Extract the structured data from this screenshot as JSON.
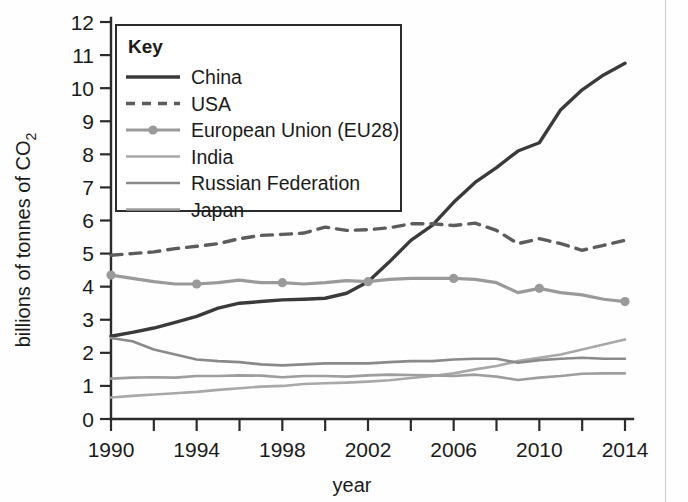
{
  "figure": {
    "background_color": "#fefefe",
    "axis_color": "#2b2b2b"
  },
  "axes": {
    "y_title": "billions of tonnes of CO",
    "y_title_sub": "2",
    "x_title": "year",
    "y_ticks": [
      "0",
      "1",
      "2",
      "3",
      "4",
      "5",
      "6",
      "7",
      "8",
      "9",
      "10",
      "11",
      "12"
    ],
    "x_ticks": [
      "1990",
      "1994",
      "1998",
      "2002",
      "2006",
      "2010",
      "2014"
    ],
    "x_minor_years": [
      1992,
      1996,
      2000,
      2004,
      2008,
      2012
    ]
  },
  "legend": {
    "title": "Key",
    "items": [
      {
        "label": "China",
        "color": "#3a3a3a",
        "style": "solid",
        "width": 3.4,
        "marker": false
      },
      {
        "label": "USA",
        "color": "#5c5c5c",
        "style": "dashed",
        "width": 3.4,
        "marker": false
      },
      {
        "label": "European Union (EU28)",
        "color": "#9a9a9a",
        "style": "solid",
        "width": 3.2,
        "marker": true
      },
      {
        "label": "India",
        "color": "#a8a8a8",
        "style": "solid",
        "width": 2.6,
        "marker": false
      },
      {
        "label": "Russian Federation",
        "color": "#8a8a8a",
        "style": "solid",
        "width": 2.6,
        "marker": false
      },
      {
        "label": "Japan",
        "color": "#9e9e9e",
        "style": "solid",
        "width": 2.6,
        "marker": false
      }
    ]
  },
  "chart_data": {
    "type": "line",
    "title": "",
    "xlabel": "year",
    "ylabel": "billions of tonnes of CO2",
    "xlim": [
      1990,
      2014
    ],
    "ylim": [
      0,
      12
    ],
    "grid": false,
    "legend_position": "upper-left-inset",
    "x": [
      1990,
      1991,
      1992,
      1993,
      1994,
      1995,
      1996,
      1997,
      1998,
      1999,
      2000,
      2001,
      2002,
      2003,
      2004,
      2005,
      2006,
      2007,
      2008,
      2009,
      2010,
      2011,
      2012,
      2013,
      2014
    ],
    "series": [
      {
        "name": "China",
        "color": "#3a3a3a",
        "style": "solid",
        "values": [
          2.5,
          2.62,
          2.75,
          2.92,
          3.1,
          3.35,
          3.5,
          3.55,
          3.6,
          3.62,
          3.65,
          3.8,
          4.15,
          4.75,
          5.4,
          5.85,
          6.55,
          7.15,
          7.6,
          8.1,
          8.35,
          9.35,
          9.95,
          10.4,
          10.75
        ]
      },
      {
        "name": "USA",
        "color": "#5c5c5c",
        "style": "dashed",
        "values": [
          4.95,
          5.0,
          5.05,
          5.15,
          5.22,
          5.3,
          5.45,
          5.55,
          5.58,
          5.62,
          5.8,
          5.7,
          5.72,
          5.78,
          5.9,
          5.9,
          5.85,
          5.92,
          5.7,
          5.3,
          5.45,
          5.3,
          5.1,
          5.25,
          5.4
        ]
      },
      {
        "name": "European Union (EU28)",
        "color": "#9a9a9a",
        "style": "solid",
        "values": [
          4.35,
          4.25,
          4.15,
          4.08,
          4.08,
          4.12,
          4.2,
          4.12,
          4.12,
          4.08,
          4.12,
          4.18,
          4.15,
          4.22,
          4.25,
          4.25,
          4.25,
          4.22,
          4.12,
          3.82,
          3.95,
          3.82,
          3.75,
          3.62,
          3.55
        ]
      },
      {
        "name": "India",
        "color": "#a8a8a8",
        "style": "solid",
        "values": [
          0.65,
          0.7,
          0.74,
          0.78,
          0.82,
          0.88,
          0.93,
          0.98,
          1.0,
          1.06,
          1.08,
          1.1,
          1.13,
          1.17,
          1.24,
          1.3,
          1.38,
          1.5,
          1.6,
          1.75,
          1.85,
          1.95,
          2.1,
          2.25,
          2.4
        ]
      },
      {
        "name": "Russian Federation",
        "color": "#8a8a8a",
        "style": "solid",
        "values": [
          2.45,
          2.35,
          2.1,
          1.95,
          1.8,
          1.75,
          1.72,
          1.65,
          1.62,
          1.65,
          1.68,
          1.68,
          1.68,
          1.72,
          1.75,
          1.75,
          1.8,
          1.82,
          1.82,
          1.7,
          1.78,
          1.82,
          1.85,
          1.82,
          1.82
        ]
      },
      {
        "name": "Japan",
        "color": "#9e9e9e",
        "style": "solid",
        "values": [
          1.22,
          1.25,
          1.26,
          1.25,
          1.3,
          1.3,
          1.32,
          1.31,
          1.26,
          1.3,
          1.3,
          1.28,
          1.32,
          1.34,
          1.33,
          1.32,
          1.3,
          1.34,
          1.28,
          1.18,
          1.25,
          1.3,
          1.37,
          1.38,
          1.38
        ]
      }
    ],
    "marker_years": [
      1990,
      1994,
      1998,
      2002,
      2006,
      2010,
      2014
    ]
  }
}
